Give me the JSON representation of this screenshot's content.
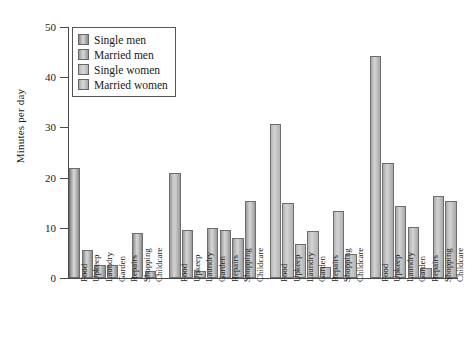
{
  "chart_data": {
    "type": "bar",
    "title": "",
    "xlabel": "",
    "ylabel": "Minutes per day",
    "ylim": [
      0,
      50
    ],
    "yticks": [
      0,
      10,
      20,
      30,
      40,
      50
    ],
    "grid": false,
    "legend_position": "top-left",
    "categories": [
      "Food",
      "Upkeep",
      "Laundry",
      "Garden",
      "Repairs",
      "Shopping",
      "Childcare"
    ],
    "series": [
      {
        "name": "Single men",
        "color": "#8a8a8a",
        "values": [
          22.0,
          5.5,
          2.5,
          2.5,
          0.0,
          9.0,
          1.3
        ]
      },
      {
        "name": "Married men",
        "color": "#9a9a9a",
        "values": [
          21.0,
          9.5,
          1.3,
          10.0,
          9.5,
          8.0,
          15.3
        ]
      },
      {
        "name": "Single women",
        "color": "#b4b4b4",
        "values": [
          30.7,
          15.0,
          6.8,
          9.3,
          2.2,
          13.3,
          4.7
        ]
      },
      {
        "name": "Married women",
        "color": "#a8a8a8",
        "values": [
          44.3,
          23.0,
          14.3,
          10.2,
          2.0,
          16.3,
          15.3
        ]
      }
    ]
  },
  "legend": {
    "entries": [
      {
        "label": "Single men"
      },
      {
        "label": "Married men"
      },
      {
        "label": "Single women"
      },
      {
        "label": "Married women"
      }
    ]
  },
  "axis": {
    "y_title": "Minutes per day",
    "y_tick_labels": [
      "0",
      "10",
      "20",
      "30",
      "40",
      "50"
    ]
  }
}
